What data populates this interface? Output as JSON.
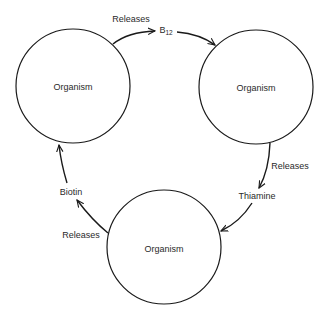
{
  "diagram": {
    "nodes": [
      {
        "id": "organism-top-left",
        "label": "Organism",
        "cx": 73,
        "cy": 86,
        "r": 57
      },
      {
        "id": "organism-top-right",
        "label": "Organism",
        "cx": 256,
        "cy": 87,
        "r": 57
      },
      {
        "id": "organism-bottom",
        "label": "Organism",
        "cx": 164,
        "cy": 247,
        "r": 57
      }
    ],
    "edge_labels": {
      "releases_top": "Releases",
      "releases_right": "Releases",
      "releases_left": "Releases"
    },
    "products": {
      "b12_base": "B",
      "b12_sub": "12",
      "thiamine": "Thiamine",
      "biotin": "Biotin"
    },
    "flows": [
      {
        "from": "organism-top-left",
        "action": "Releases",
        "product": "B12",
        "to": "organism-top-right"
      },
      {
        "from": "organism-top-right",
        "action": "Releases",
        "product": "Thiamine",
        "to": "organism-bottom"
      },
      {
        "from": "organism-bottom",
        "action": "Releases",
        "product": "Biotin",
        "to": "organism-top-left"
      }
    ],
    "colors": {
      "stroke": "#1a1a1a",
      "text": "#2a2a2a",
      "background": "#ffffff"
    }
  }
}
